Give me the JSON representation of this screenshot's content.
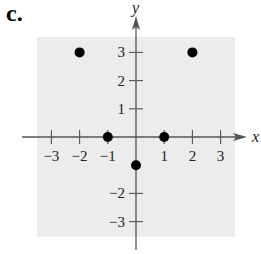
{
  "part_label": "c.",
  "colors": {
    "panel": "#ececec",
    "axis": "#555555",
    "point": "#000000"
  },
  "chart_data": {
    "type": "scatter",
    "title": "",
    "xlabel": "x",
    "ylabel": "y",
    "xlim": [
      -3.5,
      3.5
    ],
    "ylim": [
      -3.5,
      3.5
    ],
    "grid": false,
    "x_ticks": [
      -3,
      -2,
      -1,
      1,
      2,
      3
    ],
    "y_ticks": [
      -3,
      -2,
      1,
      2,
      3
    ],
    "x_tick_labels": [
      "−3",
      "−2",
      "−1",
      "1",
      "2",
      "3"
    ],
    "y_tick_labels": [
      "−3",
      "−2",
      "1",
      "2",
      "3"
    ],
    "points": [
      {
        "x": -2,
        "y": 3
      },
      {
        "x": 2,
        "y": 3
      },
      {
        "x": -1,
        "y": 0
      },
      {
        "x": 1,
        "y": 0
      },
      {
        "x": 0,
        "y": -1
      }
    ]
  }
}
